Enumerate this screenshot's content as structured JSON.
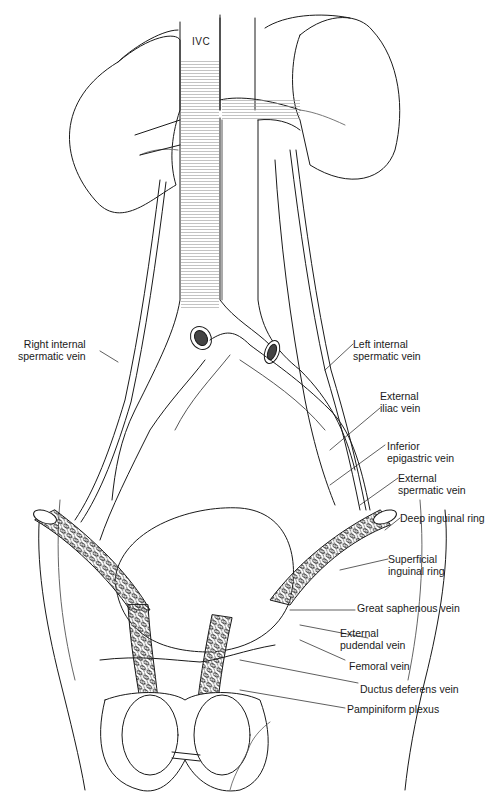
{
  "figure": {
    "title_label": "IVC",
    "labels_left": [
      {
        "id": "right-internal-spermatic-vein",
        "line1": "Right internal",
        "line2": "spermatic vein"
      }
    ],
    "labels_right": [
      {
        "id": "left-internal-spermatic-vein",
        "line1": "Left internal",
        "line2": "spermatic vein"
      },
      {
        "id": "external-iliac-vein",
        "line1": "External",
        "line2": "iliac vein"
      },
      {
        "id": "inferior-epigastric-vein",
        "line1": "Inferior",
        "line2": "epigastric vein"
      },
      {
        "id": "external-spermatic-vein",
        "line1": "External",
        "line2": "spermatic vein"
      },
      {
        "id": "deep-inguinal-ring",
        "line1": "Deep inguinal ring"
      },
      {
        "id": "superficial-inguinal-ring",
        "line1": "Superficial",
        "line2": "inguinal ring"
      },
      {
        "id": "great-saphenous-vein",
        "line1": "Great saphenous vein"
      },
      {
        "id": "external-pudendal-vein",
        "line1": "External",
        "line2": "pudendal vein"
      },
      {
        "id": "femoral-vein",
        "line1": "Femoral vein"
      },
      {
        "id": "ductus-deferens-vein",
        "line1": "Ductus deferens vein"
      },
      {
        "id": "pampiniform-plexus",
        "line1": "Pampiniform plexus"
      }
    ],
    "signature": "signature"
  }
}
